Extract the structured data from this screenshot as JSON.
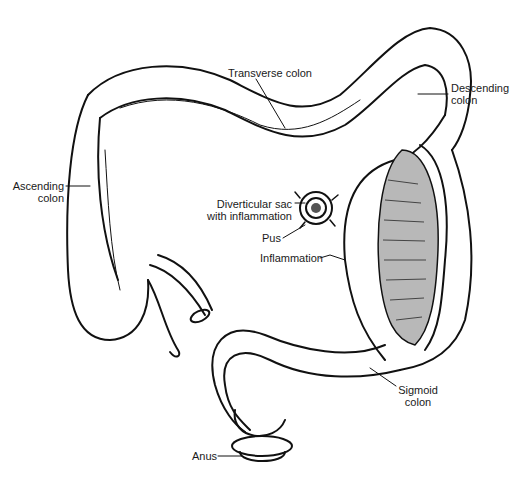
{
  "diagram": {
    "labels": {
      "transverse_colon": "Transverse colon",
      "descending_colon_1": "Descending",
      "descending_colon_2": "colon",
      "ascending_colon_1": "Ascending",
      "ascending_colon_2": "colon",
      "diverticular_sac_1": "Diverticular sac",
      "diverticular_sac_2": "with inflammation",
      "pus": "Pus",
      "inflammation": "Inflammation",
      "sigmoid_colon_1": "Sigmoid",
      "sigmoid_colon_2": "colon",
      "anus": "Anus"
    },
    "colors": {
      "line": "#111111",
      "lumen_fill": "#b8b8b8",
      "background": "#ffffff"
    }
  }
}
